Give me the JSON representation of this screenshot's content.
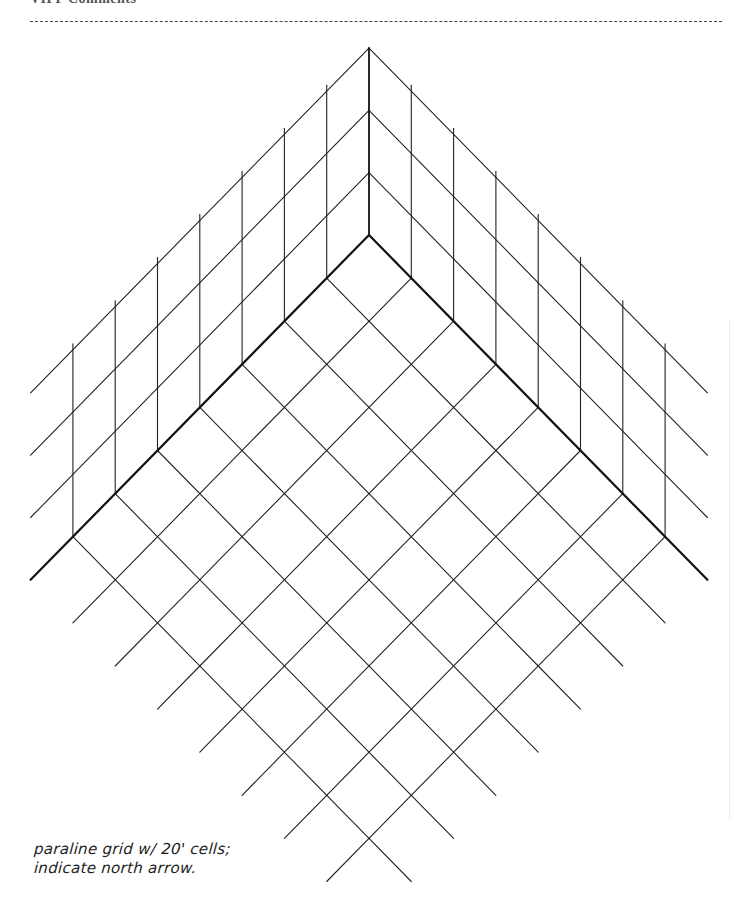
{
  "header": {
    "title": "VIPP Comments"
  },
  "drawing": {
    "type": "paraline-grid",
    "corner_top": [
      369,
      48
    ],
    "corner_base": [
      369,
      235
    ],
    "cell": 42.3,
    "cell_dy": 43.1,
    "wall_height_levels": 3,
    "wall_level_dy": 62.3,
    "floor_cells": 7,
    "wall_extent": 8,
    "stroke_color": "#222222",
    "thick_stroke_color": "#111111"
  },
  "note": {
    "line1": "paraline grid w/ 20' cells;",
    "line2": "indicate north arrow."
  }
}
